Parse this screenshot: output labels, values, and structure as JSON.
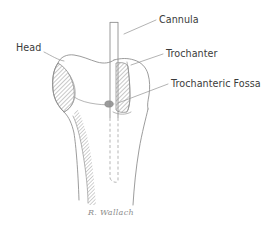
{
  "figure": {
    "background_color": "#ffffff",
    "line_color": "#8a8a8a",
    "text_color": "#3b3b3b",
    "signature_color": "#8d8d8d"
  },
  "labels": {
    "head": "Head",
    "cannula": "Cannula",
    "trochanter": "Trochanter",
    "trochanteric_fossa": "Trochanteric Fossa"
  },
  "signature": {
    "text": "R. Wallach"
  },
  "anatomy": {
    "head_name": "femoral-head",
    "trochanter_name": "greater-trochanter",
    "shaft_name": "femoral-shaft",
    "fossa_name": "trochanteric-fossa",
    "cannula_name": "cannula-instrument"
  }
}
